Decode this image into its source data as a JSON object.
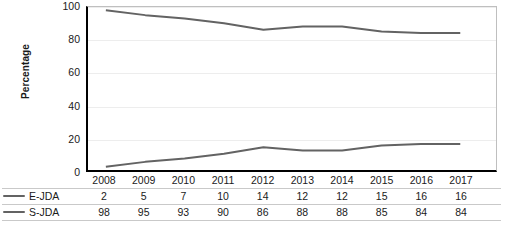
{
  "chart_data": {
    "type": "line",
    "title": "",
    "xlabel": "",
    "ylabel": "Percentage",
    "categories": [
      "2008",
      "2009",
      "2010",
      "2011",
      "2012",
      "2013",
      "2014",
      "2015",
      "2016",
      "2017"
    ],
    "series": [
      {
        "name": "E-JDA",
        "values": [
          2,
          5,
          7,
          10,
          14,
          12,
          12,
          15,
          16,
          16
        ],
        "color": "#636363"
      },
      {
        "name": "S-JDA",
        "values": [
          98,
          95,
          93,
          90,
          86,
          88,
          88,
          85,
          84,
          84
        ],
        "color": "#636363"
      }
    ],
    "ylim": [
      0,
      100
    ],
    "yticks": [
      0,
      20,
      40,
      60,
      80,
      100
    ],
    "ytick_labels": [
      "0",
      "20",
      "40",
      "60",
      "80",
      "100"
    ],
    "grid": true,
    "grid_axis": "y",
    "legend_position": "table-left",
    "has_data_table": true,
    "gridline_color": "#ededed",
    "axis_color": "#000000",
    "plot_border_color": "#bfbfbf",
    "background_color": "#ffffff"
  }
}
